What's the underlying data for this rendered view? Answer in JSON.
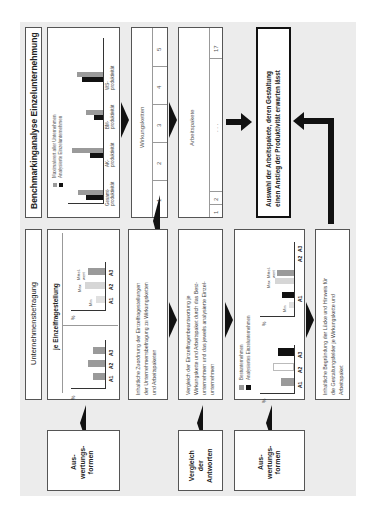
{
  "top_section": {
    "title": "Benchmarkinganalyse Einzelunternehmung",
    "chart": {
      "legend": [
        "Maximalwert aller Unternehmen",
        "Analysierte Einzelunternehmen"
      ],
      "categories": [
        "Gesamt-\nproduktivität",
        "AK-\nproduktivität",
        "BM-\nproduktivität",
        "WS-\nproduktivität"
      ],
      "cat_line1": [
        "Gesamt-",
        "AK-",
        "BM-",
        "WS-"
      ],
      "cat_line2": [
        "produktivität",
        "produktivität",
        "produktivität",
        "produktivität"
      ]
    },
    "wirkungsketten": {
      "label": "Wirkungsketten",
      "cells": [
        "1",
        "2",
        "3",
        "4",
        "5"
      ]
    },
    "arbeitspakete": {
      "label": "Arbeitspakete",
      "cells": [
        "1",
        "2",
        ". . .",
        "17"
      ]
    },
    "auswahl": {
      "line1": "Auswahl der Arbeitspakete, deren Gestaltung",
      "line2": "einen Anstieg der Produktivität erwarten lässt"
    }
  },
  "bottom_section": {
    "title": "Unternehmensbefragung",
    "chart": {
      "subtitle": "je Einzelfragestellung",
      "y_label": "%",
      "categories": [
        "A1",
        "A2",
        "A3"
      ],
      "min_label": "Min",
      "max_label": "Max",
      "mittel_label_1": "Mittel-",
      "mittel_label_2": "wert"
    },
    "text1": {
      "lines": [
        "Inhaltliche Zuordnung der Einzelfragestellungen",
        "der Unternehmensbefragung zu Wirkungsketten",
        "und Arbeitspaketen"
      ]
    },
    "text2": {
      "lines": [
        "Vergleich der Einzelfragenbeantwortung je",
        "Wirkungskette und Arbeitspaket durch das Best-",
        "unternehmen und das jeweils analysierte Einzel-",
        "unternehmen"
      ]
    },
    "chart2": {
      "legend": [
        "Bestunternehmen",
        "Analysiertes Einzelunternehmen"
      ],
      "y_label": "%",
      "categories": [
        "A1",
        "A2",
        "A3"
      ],
      "min_label": "Min",
      "max_label": "Max",
      "mittel_label_1": "Mittel-",
      "mittel_label_2": "wert"
    },
    "text3": {
      "lines": [
        "Inhaltliche Begründung der Lücke und Hinweis für",
        "die Gestaltungsfelder je Wirkungskette und",
        "Arbeitspaket"
      ]
    }
  },
  "labels": [
    {
      "lines": [
        "Aus-",
        "wertungs-",
        "formen"
      ]
    },
    {
      "lines": [
        "Vergleich",
        "der",
        "Antworten"
      ]
    },
    {
      "lines": [
        "Aus-",
        "wertungs-",
        "formen"
      ]
    }
  ],
  "colors": {
    "gray_bar": "#9a9a9a",
    "light_bar": "#cfcfcf",
    "black_bar": "#111111",
    "background": "#ececec"
  }
}
